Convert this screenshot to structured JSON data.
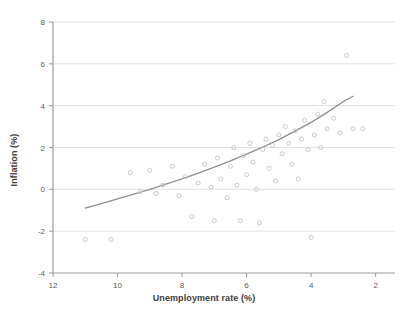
{
  "chart_data": {
    "type": "scatter",
    "title": "",
    "xlabel": "Unemployment rate (%)",
    "ylabel": "Inflation (%)",
    "xlim": [
      12,
      1.4
    ],
    "ylim": [
      -4,
      8
    ],
    "x_reversed": true,
    "xticks": [
      12,
      10,
      8,
      6,
      4,
      2
    ],
    "yticks": [
      -4,
      -2,
      0,
      2,
      4,
      6,
      8
    ],
    "xtick_labels": [
      "12",
      "10",
      "8",
      "6",
      "4",
      "2"
    ],
    "ytick_labels": [
      "-4",
      "-2",
      "0",
      "2",
      "4",
      "6",
      "8"
    ],
    "grid": "horizontal",
    "legend": "none",
    "marker_color": "#c9c9c9",
    "fit_line_color": "#8f8f8f",
    "axis_color": "#9a9a9a",
    "grid_color": "#e2e2e2",
    "series": [
      {
        "name": "Observations",
        "points": [
          [
            11.0,
            -2.4
          ],
          [
            10.2,
            -2.4
          ],
          [
            9.6,
            0.8
          ],
          [
            9.3,
            -0.1
          ],
          [
            9.0,
            0.9
          ],
          [
            8.8,
            -0.2
          ],
          [
            8.6,
            0.2
          ],
          [
            8.3,
            1.1
          ],
          [
            8.1,
            -0.3
          ],
          [
            7.9,
            0.6
          ],
          [
            7.7,
            -1.3
          ],
          [
            7.5,
            0.3
          ],
          [
            7.3,
            1.2
          ],
          [
            7.1,
            0.1
          ],
          [
            7.0,
            -1.5
          ],
          [
            6.9,
            1.5
          ],
          [
            6.8,
            0.5
          ],
          [
            6.6,
            -0.4
          ],
          [
            6.5,
            1.1
          ],
          [
            6.4,
            2.0
          ],
          [
            6.3,
            0.2
          ],
          [
            6.2,
            -1.5
          ],
          [
            6.1,
            1.6
          ],
          [
            6.0,
            0.7
          ],
          [
            5.9,
            2.2
          ],
          [
            5.8,
            1.3
          ],
          [
            5.7,
            0.0
          ],
          [
            5.6,
            -1.6
          ],
          [
            5.5,
            1.9
          ],
          [
            5.4,
            2.4
          ],
          [
            5.3,
            1.0
          ],
          [
            5.2,
            2.1
          ],
          [
            5.1,
            0.4
          ],
          [
            5.0,
            2.6
          ],
          [
            4.9,
            1.7
          ],
          [
            4.8,
            3.0
          ],
          [
            4.7,
            2.2
          ],
          [
            4.6,
            1.2
          ],
          [
            4.5,
            2.8
          ],
          [
            4.4,
            0.5
          ],
          [
            4.3,
            2.4
          ],
          [
            4.2,
            3.3
          ],
          [
            4.1,
            1.9
          ],
          [
            4.0,
            -2.3
          ],
          [
            3.9,
            2.6
          ],
          [
            3.8,
            3.6
          ],
          [
            3.7,
            2.0
          ],
          [
            3.6,
            4.2
          ],
          [
            3.5,
            2.9
          ],
          [
            3.3,
            3.4
          ],
          [
            3.1,
            2.7
          ],
          [
            2.9,
            6.4
          ],
          [
            2.7,
            2.9
          ],
          [
            2.4,
            2.9
          ]
        ]
      }
    ],
    "fit_line": {
      "name": "Fitted curve",
      "points": [
        [
          11.0,
          -0.9
        ],
        [
          10.5,
          -0.68
        ],
        [
          10.0,
          -0.46
        ],
        [
          9.5,
          -0.23
        ],
        [
          9.0,
          0.0
        ],
        [
          8.5,
          0.25
        ],
        [
          8.0,
          0.5
        ],
        [
          7.5,
          0.78
        ],
        [
          7.0,
          1.06
        ],
        [
          6.5,
          1.36
        ],
        [
          6.0,
          1.68
        ],
        [
          5.5,
          2.02
        ],
        [
          5.0,
          2.38
        ],
        [
          4.5,
          2.78
        ],
        [
          4.0,
          3.2
        ],
        [
          3.5,
          3.68
        ],
        [
          3.0,
          4.2
        ],
        [
          2.7,
          4.45
        ]
      ]
    }
  }
}
